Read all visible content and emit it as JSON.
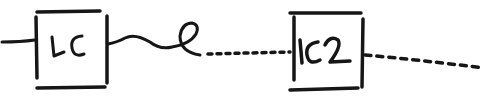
{
  "diagram": {
    "style": "hand-drawn sketch",
    "ink_color": "#161616",
    "background": "#ffffff",
    "nodes": [
      {
        "id": "lc",
        "label": "LC"
      },
      {
        "id": "lc2",
        "label": "LC2"
      }
    ],
    "edges": [
      {
        "from": "input",
        "to": "lc",
        "style": "solid"
      },
      {
        "from": "lc",
        "to": "loop",
        "style": "solid-wave"
      },
      {
        "from": "loop",
        "to": "lc2",
        "style": "dotted"
      },
      {
        "from": "lc2",
        "to": "output",
        "style": "dashed"
      }
    ]
  }
}
